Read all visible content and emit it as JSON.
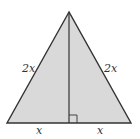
{
  "diagram": {
    "type": "isosceles-triangle-with-altitude",
    "colors": {
      "fill": "#d9d9d9",
      "stroke": "#333333",
      "background": "#ffffff"
    },
    "labels": {
      "left_side": "2x",
      "right_side": "2x",
      "left_base": "x",
      "right_base": "x"
    },
    "right_angle_marker": true
  }
}
